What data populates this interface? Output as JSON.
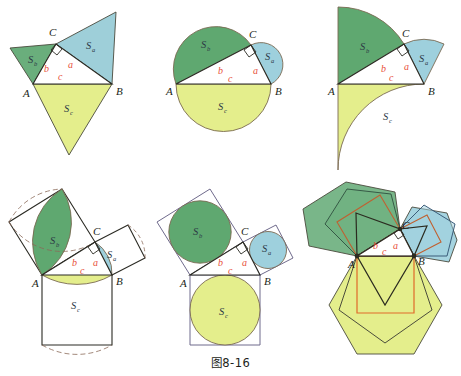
{
  "caption": "图8-16",
  "colors": {
    "green": "#5fa870",
    "green_light": "#7fbd8a",
    "blue": "#9ed0dd",
    "blue_dark": "#8cc6d6",
    "yellow": "#e4ee8c",
    "outline_dark": "#3a3a32",
    "outline_brown": "#7a6a52",
    "outline_purple": "#6f6a8c",
    "outline_orange": "#e06a2a",
    "outline_navy": "#2f4f6e",
    "side_label_red": "#e8503a",
    "vertex_label": "#231f20",
    "background": "#ffffff"
  },
  "labels": {
    "vertex_a": "A",
    "vertex_b": "B",
    "vertex_c": "C",
    "side_a": "a",
    "side_b": "b",
    "side_c": "c",
    "area_s": "S",
    "area_sub_a": "a",
    "area_sub_b": "b",
    "area_sub_c": "c"
  },
  "panels": [
    {
      "id": "panel-1",
      "name": "similar-triangles-on-sides",
      "description": "Similar triangles erected on each side of the right triangle"
    },
    {
      "id": "panel-2",
      "name": "semicircles-on-sides",
      "description": "Semicircles erected on each side of the right triangle"
    },
    {
      "id": "panel-3",
      "name": "quarter-sectors-on-sides",
      "description": "Quarter-circle sectors erected on each side of the right triangle"
    },
    {
      "id": "panel-4",
      "name": "lens-petals-in-squares",
      "description": "Lens/petal shapes inscribed in squares on each side, with dashed construction arcs"
    },
    {
      "id": "panel-5",
      "name": "inscribed-circles-in-squares",
      "description": "Circles inscribed in squares erected on each side"
    },
    {
      "id": "panel-6",
      "name": "nested-regular-polygons",
      "description": "Nested regular polygons (triangle, square, pentagon, hexagon) on each side"
    }
  ]
}
